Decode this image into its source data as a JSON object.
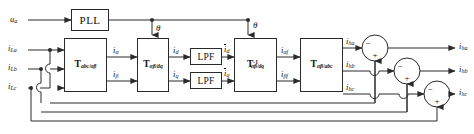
{
  "diagram": {
    "line_color": "#2a2a2a",
    "text_color": "#111111",
    "background": "#ffffff"
  },
  "inputs": {
    "voltage": {
      "base": "u",
      "sub": "a"
    },
    "currents": [
      {
        "base": "i",
        "sub": "La"
      },
      {
        "base": "i",
        "sub": "Lb"
      },
      {
        "base": "i",
        "sub": "Lc"
      }
    ]
  },
  "blocks": {
    "pll": {
      "label": "PLL",
      "name": "pll-block"
    },
    "abc_alphabeta": {
      "base": "T",
      "sub": "abc/αβ",
      "sup": "",
      "name": "t-abc-alphabeta-block"
    },
    "alphabeta_dq": {
      "base": "T",
      "sub": "αβ/dq",
      "sup": "",
      "name": "t-alphabeta-dq-block"
    },
    "lpf_d": {
      "label": "LPF",
      "name": "lpf-d-block"
    },
    "lpf_q": {
      "label": "LPF",
      "name": "lpf-q-block"
    },
    "dq_alphabeta_inv": {
      "base": "T",
      "sub": "αβ/dq",
      "sup": "-1",
      "name": "t-alphabeta-dq-inverse-block"
    },
    "alphabeta_abc": {
      "base": "T",
      "sub": "αβ/abc",
      "sup": "",
      "name": "t-alphabeta-abc-block"
    }
  },
  "signals": {
    "theta": "θ",
    "i_alpha": {
      "base": "i",
      "sub": "α"
    },
    "i_beta": {
      "base": "i",
      "sub": "β"
    },
    "i_d": {
      "base": "i",
      "sub": "d"
    },
    "i_q": {
      "base": "i",
      "sub": "q"
    },
    "i_d_bar": {
      "base": "i",
      "sub": "d"
    },
    "i_q_bar": {
      "base": "i",
      "sub": "q"
    },
    "i_alpha_f": {
      "base": "i",
      "sub": "αf"
    },
    "i_beta_f": {
      "base": "i",
      "sub": "βf"
    },
    "i_ha_mid": {
      "base": "i",
      "sub": "ha"
    },
    "i_hb_mid": {
      "base": "i",
      "sub": "hb"
    },
    "i_hc_mid": {
      "base": "i",
      "sub": "hc"
    }
  },
  "outputs": [
    {
      "base": "i",
      "sub": "ha"
    },
    {
      "base": "i",
      "sub": "hb"
    },
    {
      "base": "i",
      "sub": "hc"
    }
  ],
  "summing_junctions": [
    {
      "name": "sum-a",
      "minus": "−",
      "plus": "+"
    },
    {
      "name": "sum-b",
      "minus": "−",
      "plus": "+"
    },
    {
      "name": "sum-c",
      "minus": "−",
      "plus": "+"
    }
  ]
}
